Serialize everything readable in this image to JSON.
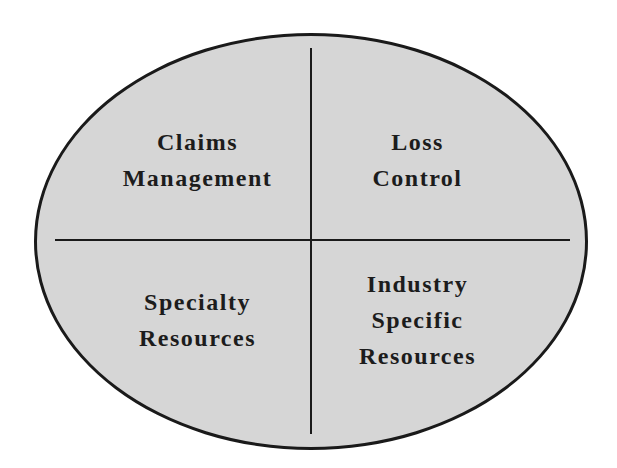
{
  "diagram": {
    "shape": "ellipse divided into four quadrants",
    "colors": {
      "fill": "#d6d6d6",
      "stroke": "#1a1a1a",
      "text": "#1c1c1c",
      "background": "#ffffff"
    },
    "quadrants": {
      "top_left": {
        "lines": [
          "Claims",
          "Management"
        ]
      },
      "top_right": {
        "lines": [
          "Loss",
          "Control"
        ]
      },
      "bottom_left": {
        "lines": [
          "Specialty",
          "Resources"
        ]
      },
      "bottom_right": {
        "lines": [
          "Industry",
          "Specific",
          "Resources"
        ]
      }
    }
  }
}
